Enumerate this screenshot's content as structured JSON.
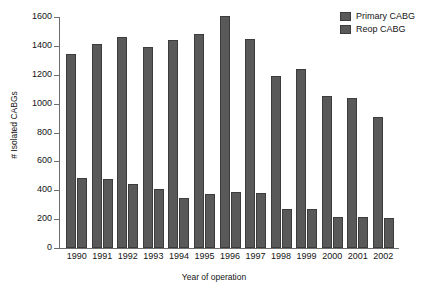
{
  "chart_data": {
    "type": "bar",
    "title": "",
    "xlabel": "Year of operation",
    "ylabel": "# Isolated CABGs",
    "categories": [
      "1990",
      "1991",
      "1992",
      "1993",
      "1994",
      "1995",
      "1996",
      "1997",
      "1998",
      "1999",
      "2000",
      "2001",
      "2002"
    ],
    "series": [
      {
        "name": "Primary CABG",
        "color": "#595959",
        "values": [
          1345,
          1410,
          1465,
          1395,
          1440,
          1485,
          1605,
          1445,
          1190,
          1240,
          1055,
          1040,
          905
        ]
      },
      {
        "name": "Reop CABG",
        "color": "#595959",
        "values": [
          485,
          480,
          440,
          410,
          345,
          375,
          385,
          380,
          270,
          270,
          215,
          215,
          205
        ]
      }
    ],
    "ylim": [
      0,
      1600
    ],
    "yticks": [
      0,
      200,
      400,
      600,
      800,
      1000,
      1200,
      1400,
      1600
    ],
    "ytick_labels": [
      "0",
      "200",
      "400",
      "600",
      "800",
      "1000",
      "1200",
      "1400",
      "1600"
    ],
    "grid": false,
    "legend_position": "top-right"
  },
  "legend": {
    "entries": [
      {
        "label": "Primary CABG"
      },
      {
        "label": "Reop CABG"
      }
    ]
  }
}
